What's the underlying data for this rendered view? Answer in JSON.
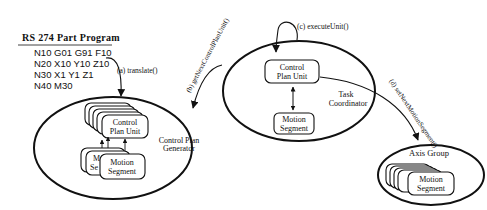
{
  "diagram": {
    "program": {
      "title": "RS 274 Part Program",
      "lines": [
        "N10 G01 G91 F10",
        "N20 X10 Y10 Z10",
        "N30 X1 Y1 Z1",
        "N40 M30"
      ]
    },
    "arrows": {
      "a": "(a) translate()",
      "b": "(b) getNextControlPlanUnit()",
      "c": "(c) executeUnit()",
      "d": "(d) setNextMotionSegment()"
    },
    "generator": {
      "label_line1": "Control Plan",
      "label_line2": "Generator",
      "cpu_line1": "Control",
      "cpu_line2": "Plan Unit",
      "ms_line1": "Motion",
      "ms_line2": "Segment",
      "ms_partial_line1": "M",
      "ms_partial_line2": "Se"
    },
    "coordinator": {
      "label_line1": "Task",
      "label_line2": "Coordinator",
      "cpu_line1": "Control",
      "cpu_line2": "Plan Unit",
      "ms_line1": "Motion",
      "ms_line2": "Segment"
    },
    "axis_group": {
      "label": "Axis Group",
      "ms_line1": "Motion",
      "ms_line2": "Segment"
    }
  }
}
